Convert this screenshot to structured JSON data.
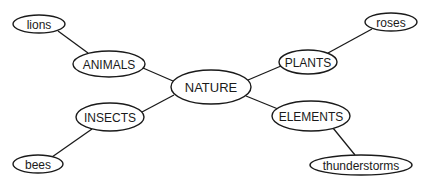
{
  "diagram": {
    "title": "",
    "type": "concept-map",
    "colors": {
      "stroke": "#1a1a1a",
      "fill": "#ffffff",
      "text": "#1a1a1a",
      "background": "#ffffff"
    },
    "nodes": [
      {
        "id": "nature",
        "label": "NATURE",
        "cx": 211,
        "cy": 87,
        "rx": 40,
        "ry": 17,
        "font_size": 13,
        "level": "root"
      },
      {
        "id": "animals",
        "label": "ANIMALS",
        "cx": 109,
        "cy": 64,
        "rx": 36,
        "ry": 13,
        "font_size": 12,
        "level": "category"
      },
      {
        "id": "insects",
        "label": "INSECTS",
        "cx": 110,
        "cy": 117,
        "rx": 34,
        "ry": 14,
        "font_size": 12,
        "level": "category"
      },
      {
        "id": "plants",
        "label": "PLANTS",
        "cx": 308,
        "cy": 62,
        "rx": 29,
        "ry": 12,
        "font_size": 12,
        "level": "category"
      },
      {
        "id": "elements",
        "label": "ELEMENTS",
        "cx": 311,
        "cy": 116,
        "rx": 39,
        "ry": 15,
        "font_size": 12,
        "level": "category"
      },
      {
        "id": "lions",
        "label": "lions",
        "cx": 39,
        "cy": 24,
        "rx": 26,
        "ry": 9,
        "font_size": 12,
        "level": "example"
      },
      {
        "id": "bees",
        "label": "bees",
        "cx": 38,
        "cy": 164,
        "rx": 25,
        "ry": 9,
        "font_size": 12,
        "level": "example"
      },
      {
        "id": "roses",
        "label": "roses",
        "cx": 391,
        "cy": 22,
        "rx": 26,
        "ry": 9,
        "font_size": 12,
        "level": "example"
      },
      {
        "id": "thunderstorms",
        "label": "thunderstorms",
        "cx": 361,
        "cy": 165,
        "rx": 51,
        "ry": 10,
        "font_size": 12,
        "level": "example"
      }
    ],
    "edges": [
      {
        "from": "nature",
        "to": "animals",
        "x1": 173,
        "y1": 81,
        "x2": 143,
        "y2": 68
      },
      {
        "from": "nature",
        "to": "insects",
        "x1": 174,
        "y1": 95,
        "x2": 142,
        "y2": 112
      },
      {
        "from": "nature",
        "to": "plants",
        "x1": 248,
        "y1": 80,
        "x2": 281,
        "y2": 66
      },
      {
        "from": "nature",
        "to": "elements",
        "x1": 246,
        "y1": 96,
        "x2": 278,
        "y2": 109
      },
      {
        "from": "animals",
        "to": "lions",
        "x1": 88,
        "y1": 53,
        "x2": 58,
        "y2": 31
      },
      {
        "from": "insects",
        "to": "bees",
        "x1": 92,
        "y1": 129,
        "x2": 52,
        "y2": 157
      },
      {
        "from": "plants",
        "to": "roses",
        "x1": 328,
        "y1": 53,
        "x2": 372,
        "y2": 29
      },
      {
        "from": "elements",
        "to": "thunderstorms",
        "x1": 333,
        "y1": 128,
        "x2": 355,
        "y2": 155
      }
    ]
  }
}
